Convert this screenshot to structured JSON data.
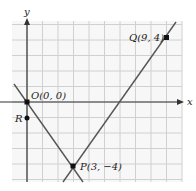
{
  "diagram": {
    "type": "coordinate-plane",
    "axes": {
      "x_label": "x",
      "y_label": "y"
    },
    "grid": {
      "x_min": -1,
      "x_max": 10,
      "y_min": -5,
      "y_max": 5,
      "spacing_px": 15.5
    },
    "origin_px": {
      "x": 27,
      "y": 102
    },
    "points": [
      {
        "id": "O",
        "label": "O(0, 0)",
        "x": 0,
        "y": 0
      },
      {
        "id": "Q",
        "label": "Q(9, 4)",
        "x": 9,
        "y": 4
      },
      {
        "id": "P",
        "label": "P(3, −4)",
        "x": 3,
        "y": -4
      },
      {
        "id": "R",
        "label": "R",
        "x": 0,
        "y": -1
      }
    ],
    "lines": [
      {
        "id": "line-OP",
        "through": [
          "O",
          "P"
        ]
      },
      {
        "id": "line-PQ",
        "through": [
          "P",
          "Q"
        ]
      }
    ],
    "colors": {
      "grid": "#d0d0d0",
      "grid_bg": "#f7f7f7",
      "axis": "#333333",
      "line": "#555555",
      "point": "#111111"
    }
  }
}
